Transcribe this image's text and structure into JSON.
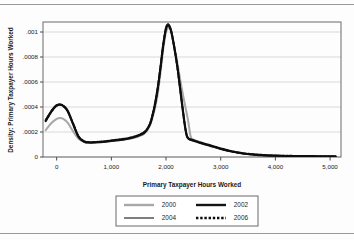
{
  "figure": {
    "has_top_rule": true,
    "has_bottom_rule": true,
    "background": "#fdfdfd"
  },
  "chart_data": {
    "type": "line",
    "title": "",
    "subtitle": "",
    "xlabel": "Primary Taxpayer Hours Worked",
    "ylabel": "Density: Primary Taxpayer Hours Worked",
    "xlim": [
      -250,
      5200
    ],
    "ylim": [
      0,
      0.00108
    ],
    "grid": true,
    "grid_axis": "y",
    "grid_color": "#cfcfcf",
    "legend_position": "bottom-center",
    "xticks": [
      0,
      1000,
      2000,
      3000,
      4000,
      5000
    ],
    "xtick_labels": [
      "0",
      "1,000",
      "2,000",
      "3,000",
      "4,000",
      "5,000"
    ],
    "yticks": [
      0,
      0.0002,
      0.0004,
      0.0006,
      0.0008,
      0.001
    ],
    "ytick_labels": [
      "0",
      ".0002",
      ".0004",
      ".0006",
      ".0008",
      ".001"
    ],
    "series": [
      {
        "name": "2000",
        "color": "#a8a8a8",
        "style": "solid",
        "width": 2.0,
        "x": [
          -200,
          -100,
          0,
          60,
          120,
          200,
          300,
          400,
          500,
          600,
          800,
          1000,
          1200,
          1400,
          1600,
          1700,
          1750,
          1800,
          1850,
          1900,
          1950,
          2000,
          2050,
          2080,
          2120,
          2200,
          2300,
          2400,
          2450,
          2500,
          2600,
          2700,
          2800,
          3000,
          3200,
          3400,
          3600,
          3800,
          4000,
          4200,
          4500,
          4800,
          5100
        ],
        "y": [
          0.000215,
          0.00027,
          0.000305,
          0.000312,
          0.000305,
          0.000275,
          0.000205,
          0.000145,
          0.000122,
          0.000118,
          0.000122,
          0.00013,
          0.000138,
          0.000152,
          0.000185,
          0.000245,
          0.00031,
          0.000395,
          0.00051,
          0.00068,
          0.000865,
          0.001,
          0.001035,
          0.00102,
          0.000955,
          0.00077,
          0.00052,
          0.0003,
          0.000165,
          0.00014,
          0.000122,
          0.000108,
          9.5e-05,
          6.8e-05,
          4.6e-05,
          3e-05,
          2e-05,
          1.4e-05,
          1e-05,
          8e-06,
          6e-06,
          5e-06,
          4e-06
        ]
      },
      {
        "name": "2002",
        "color": "#141414",
        "style": "solid",
        "width": 2.0,
        "x": [
          -200,
          -100,
          -40,
          0,
          60,
          120,
          200,
          300,
          400,
          500,
          600,
          800,
          1000,
          1200,
          1400,
          1600,
          1700,
          1750,
          1800,
          1850,
          1900,
          1950,
          2000,
          2040,
          2080,
          2120,
          2200,
          2280,
          2340,
          2380,
          2420,
          2500,
          2600,
          2700,
          2800,
          3000,
          3200,
          3400,
          3600,
          3800,
          4000,
          4200,
          4500,
          4800,
          5100
        ],
        "y": [
          0.000295,
          0.000365,
          0.000398,
          0.000412,
          0.000418,
          0.000408,
          0.000368,
          0.000262,
          0.00016,
          0.000122,
          0.000115,
          0.000118,
          0.000128,
          0.000138,
          0.000155,
          0.000192,
          0.000255,
          0.000325,
          0.00042,
          0.000552,
          0.00072,
          0.0009,
          0.001035,
          0.00106,
          0.00103,
          0.000955,
          0.000745,
          0.00047,
          0.000265,
          0.000168,
          0.000142,
          0.00013,
          0.000115,
          0.000102,
          9e-05,
          6.4e-05,
          4.3e-05,
          2.8e-05,
          1.9e-05,
          1.3e-05,
          1e-05,
          8e-06,
          6e-06,
          5e-06,
          4e-06
        ]
      },
      {
        "name": "2004",
        "color": "#2a2a2a",
        "style": "solid",
        "width": 1.1,
        "x": [
          -200,
          -100,
          -40,
          0,
          60,
          120,
          200,
          300,
          400,
          500,
          600,
          800,
          1000,
          1200,
          1400,
          1600,
          1700,
          1750,
          1800,
          1850,
          1900,
          1950,
          2000,
          2040,
          2080,
          2120,
          2200,
          2280,
          2340,
          2380,
          2420,
          2500,
          2600,
          2700,
          2800,
          3000,
          3200,
          3400,
          3600,
          3800,
          4000,
          4200,
          4500,
          4800,
          5100
        ],
        "y": [
          0.0003,
          0.00037,
          0.000402,
          0.000418,
          0.000424,
          0.000412,
          0.000372,
          0.000264,
          0.000162,
          0.000124,
          0.000116,
          0.00012,
          0.00013,
          0.00014,
          0.000158,
          0.000196,
          0.000258,
          0.00033,
          0.000428,
          0.00056,
          0.000728,
          0.00091,
          0.00104,
          0.001065,
          0.001032,
          0.000958,
          0.000748,
          0.000472,
          0.000266,
          0.00017,
          0.000144,
          0.000132,
          0.000117,
          0.000104,
          9.2e-05,
          6.6e-05,
          4.4e-05,
          2.9e-05,
          2e-05,
          1.4e-05,
          1e-05,
          8e-06,
          6e-06,
          5e-06,
          4e-06
        ]
      },
      {
        "name": "2006",
        "color": "#0d0d0d",
        "style": "dotted",
        "width": 2.2,
        "x": [
          -200,
          -100,
          -40,
          0,
          60,
          120,
          200,
          300,
          400,
          500,
          600,
          800,
          1000,
          1200,
          1400,
          1600,
          1700,
          1750,
          1800,
          1850,
          1900,
          1950,
          2000,
          2040,
          2080,
          2120,
          2200,
          2280,
          2340,
          2380,
          2420,
          2500,
          2600,
          2700,
          2800,
          3000,
          3200,
          3400,
          3600,
          3800,
          4000,
          4200,
          4500,
          4800,
          5100
        ],
        "y": [
          0.000288,
          0.00036,
          0.000395,
          0.000412,
          0.00042,
          0.00041,
          0.00037,
          0.000268,
          0.000166,
          0.000126,
          0.000118,
          0.000122,
          0.000132,
          0.000143,
          0.00016,
          0.000198,
          0.00026,
          0.000332,
          0.00043,
          0.000558,
          0.000722,
          0.000898,
          0.001025,
          0.001052,
          0.001026,
          0.00095,
          0.000742,
          0.000468,
          0.000268,
          0.000172,
          0.000146,
          0.000134,
          0.000119,
          0.000106,
          9.4e-05,
          6.8e-05,
          4.6e-05,
          3e-05,
          2.1e-05,
          1.5e-05,
          1.1e-05,
          9e-06,
          7e-06,
          6e-06,
          5e-06
        ]
      }
    ]
  },
  "legend": {
    "entries": [
      {
        "label": "2000",
        "color": "#a8a8a8",
        "style": "solid",
        "width": 2.4
      },
      {
        "label": "2002",
        "color": "#141414",
        "style": "solid",
        "width": 2.4
      },
      {
        "label": "2004",
        "color": "#2a2a2a",
        "style": "solid",
        "width": 1.2
      },
      {
        "label": "2006",
        "color": "#0d0d0d",
        "style": "dotted",
        "width": 2.4
      }
    ]
  }
}
